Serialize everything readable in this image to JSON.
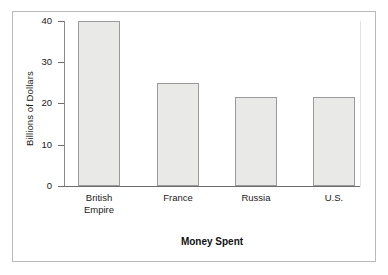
{
  "chart_data": {
    "type": "bar",
    "title_truncated": true,
    "categories": [
      "British Empire",
      "France",
      "Russia",
      "U.S."
    ],
    "values": [
      40,
      25,
      21.5,
      21.5
    ],
    "xlabel": "Money Spent",
    "ylabel": "Billions of Dollars",
    "ylim": [
      0,
      40
    ],
    "yticks": [
      0,
      10,
      20,
      30,
      40
    ],
    "ytick_labels": [
      "0",
      "10",
      "20",
      "30",
      "40"
    ],
    "grid": false,
    "legend": false,
    "bar_fill_color": "#e9e9e7",
    "bar_border_color": "#9a9a9a",
    "axis_color": "#6e6e6e",
    "frame_color": "#b9b9b9",
    "text_color": "#1a1a1a"
  },
  "category_labels": [
    {
      "line1": "British",
      "line2": "Empire"
    },
    {
      "line1": "France",
      "line2": ""
    },
    {
      "line1": "Russia",
      "line2": ""
    },
    {
      "line1": "U.S.",
      "line2": ""
    }
  ]
}
